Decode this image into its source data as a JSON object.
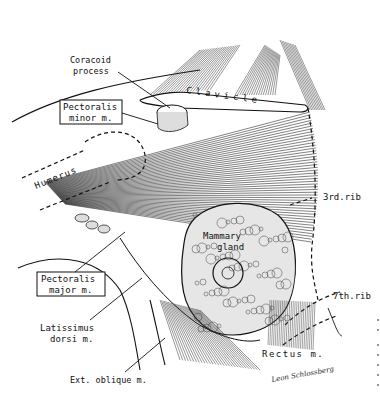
{
  "figure": {
    "type": "anatomical illustration",
    "labels": {
      "coracoid_process": [
        "Coracoid",
        "process"
      ],
      "clavicle": "Clavicle",
      "pectoralis_minor": [
        "Pectoralis",
        "minor m."
      ],
      "humerus": "Humerus",
      "third_rib": "3rd.rib",
      "mammary_gland": [
        "Mammary",
        "gland"
      ],
      "pectoralis_major": [
        "Pectoralis",
        "major m."
      ],
      "latissimus_dorsi": [
        "Latissimus",
        "dorsi m."
      ],
      "seventh_rib": "7th.rib",
      "rectus": "Rectus m.",
      "ext_oblique": "Ext. oblique m."
    },
    "signature": "Leon Schlossberg",
    "colors": {
      "ink": "#111111",
      "paper": "#ffffff"
    }
  }
}
